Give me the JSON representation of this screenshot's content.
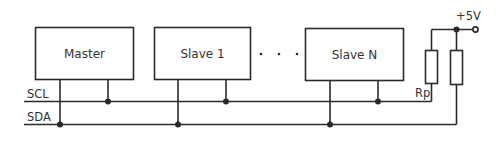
{
  "diagram": {
    "colors": {
      "line": "#2a2a2a",
      "text": "#333333",
      "background": "#ffffff"
    },
    "devices": [
      {
        "label": "Master"
      },
      {
        "label": "Slave 1"
      },
      {
        "label": "Slave N"
      }
    ],
    "ellipsis": "·  ·  ·",
    "buses": [
      {
        "label": "SCL"
      },
      {
        "label": "SDA"
      }
    ],
    "pullup": {
      "resistor_label": "Rp",
      "supply_label": "+5V"
    }
  }
}
